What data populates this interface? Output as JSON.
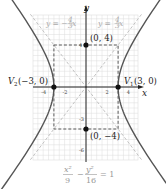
{
  "chart_data": {
    "type": "line",
    "title": "",
    "equation": {
      "numerator_left": "x²",
      "denominator_left": "9",
      "minus": "−",
      "numerator_right": "y²",
      "denominator_right": "16",
      "equals": "= 1"
    },
    "xlabel": "x",
    "ylabel": "y",
    "xlim": [
      -5,
      5
    ],
    "ylim": [
      -6.8,
      6.8
    ],
    "grid": true,
    "x_ticks": [
      {
        "value": -4,
        "label": "-4"
      },
      {
        "value": -2,
        "label": "-2"
      },
      {
        "value": 2,
        "label": "2"
      },
      {
        "value": 4,
        "label": "4"
      }
    ],
    "y_ticks": [
      {
        "value": 4,
        "label": "4"
      },
      {
        "value": -3,
        "label": "-3"
      },
      {
        "value": -6,
        "label": "-6"
      }
    ],
    "asymptotes": [
      {
        "label": "y = −(4/3)x",
        "text_left": "y = −",
        "frac_num": "4",
        "frac_den": "3",
        "text_right": "x",
        "slope": -1.3333
      },
      {
        "label": "y = (4/3)x",
        "text_left": "y = ",
        "frac_num": "4",
        "frac_den": "3",
        "text_right": "x",
        "slope": 1.3333
      }
    ],
    "points": [
      {
        "name": "V1",
        "x": 3,
        "y": 0,
        "label_main": "V",
        "label_sub": "1",
        "label_coords": "(3, 0)"
      },
      {
        "name": "V2",
        "x": -3,
        "y": 0,
        "label_main": "V",
        "label_sub": "2",
        "label_coords": "(−3, 0)"
      },
      {
        "name": "co-vertex-top",
        "x": 0,
        "y": 4,
        "label_coords": "(0, 4)"
      },
      {
        "name": "co-vertex-bottom",
        "x": 0,
        "y": -4,
        "label_coords": "(0, −4)"
      }
    ],
    "fundamental_rectangle": {
      "x": [
        -3,
        3
      ],
      "y": [
        -4,
        4
      ]
    },
    "series": [
      {
        "name": "hyperbola x²/9 − y²/16 = 1",
        "a": 3,
        "b": 4
      }
    ],
    "colors": {
      "curve": "#555555",
      "asymptote": "#bbbbbb",
      "grid": "#dddddd",
      "axis": "#222222",
      "rectangle": "#333333",
      "point": "#111111"
    }
  }
}
